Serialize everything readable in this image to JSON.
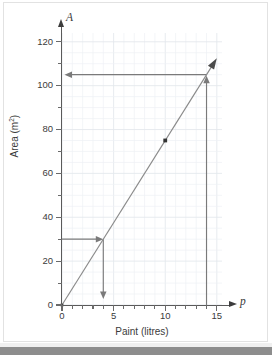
{
  "chart_data": {
    "type": "line",
    "title": "",
    "xlabel": "Paint (litres)",
    "ylabel": "Area (m²)",
    "x_axis_symbol": "p",
    "y_axis_symbol": "A",
    "xlim": [
      0,
      15.5
    ],
    "ylim": [
      0,
      124
    ],
    "grid": true,
    "grid_minor_x_step": 1,
    "grid_minor_y_step": 5,
    "legend": "none",
    "x_ticks_major": [
      0,
      5,
      10,
      15
    ],
    "x_tick_labels": [
      "0",
      "5",
      "10",
      "15"
    ],
    "x_ticks_minor": [
      1,
      2,
      3,
      4,
      6,
      7,
      8,
      9,
      11,
      12,
      13,
      14
    ],
    "y_ticks_major": [
      0,
      20,
      40,
      60,
      80,
      100,
      120
    ],
    "y_tick_labels": [
      "0",
      "20",
      "40",
      "60",
      "80",
      "100",
      "120"
    ],
    "y_ticks_minor": [
      10,
      30,
      50,
      70,
      90,
      110
    ],
    "series": [
      {
        "name": "Area covered by paint",
        "type": "line",
        "relation": "A = 7.5p",
        "x": [
          0,
          15
        ],
        "values": [
          0,
          112.5
        ],
        "color": "#8a8a8a",
        "arrow_end": true
      }
    ],
    "points": [
      {
        "label": "plotted point",
        "x": 10,
        "y": 75,
        "marker": "square",
        "color": "#333333"
      }
    ],
    "annotations": [
      {
        "name": "read-up-from-14",
        "type": "arrow",
        "direction": "up",
        "from": [
          14,
          0
        ],
        "to": [
          14,
          105
        ],
        "color": "#7a7a7a"
      },
      {
        "name": "read-across-to-A-105",
        "type": "arrow",
        "direction": "left",
        "from": [
          14,
          105
        ],
        "to": [
          0,
          105
        ],
        "color": "#7a7a7a"
      },
      {
        "name": "read-across-from-A-30",
        "type": "arrow",
        "direction": "right",
        "from": [
          0,
          30
        ],
        "to": [
          4,
          30
        ],
        "color": "#7a7a7a"
      },
      {
        "name": "read-down-to-p-4",
        "type": "arrow",
        "direction": "down",
        "from": [
          4,
          30
        ],
        "to": [
          4,
          0
        ],
        "color": "#7a7a7a"
      }
    ],
    "colors": {
      "grid_minor": "#eef1f5",
      "grid_major": "#e3e7ec",
      "axis": "#5a5a5a",
      "line": "#8a8a8a",
      "annotation": "#7a7a7a",
      "text": "#3b3b3b",
      "background": "#ffffff"
    }
  }
}
